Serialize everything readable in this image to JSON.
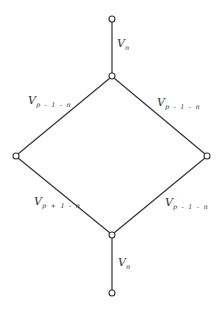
{
  "diagram": {
    "type": "lattice",
    "nodes": [
      {
        "id": "top",
        "x": 112,
        "y": 19
      },
      {
        "id": "upper",
        "x": 112,
        "y": 76
      },
      {
        "id": "left",
        "x": 16,
        "y": 156
      },
      {
        "id": "right",
        "x": 207,
        "y": 156
      },
      {
        "id": "lower",
        "x": 112,
        "y": 235
      },
      {
        "id": "bottom",
        "x": 112,
        "y": 293
      }
    ],
    "edges": [
      {
        "from": "top",
        "to": "upper",
        "label": {
          "base": "V",
          "sub": "n"
        }
      },
      {
        "from": "upper",
        "to": "left",
        "label": {
          "base": "V",
          "sub": "p-1-n"
        }
      },
      {
        "from": "upper",
        "to": "right",
        "label": {
          "base": "V",
          "sub": "p-1-n"
        }
      },
      {
        "from": "left",
        "to": "lower",
        "label": {
          "base": "V",
          "sub": "p+1-n"
        }
      },
      {
        "from": "right",
        "to": "lower",
        "label": {
          "base": "V",
          "sub": "p-1-n"
        }
      },
      {
        "from": "lower",
        "to": "bottom",
        "label": {
          "base": "V",
          "sub": "n"
        }
      }
    ]
  },
  "labels": {
    "top_edge": {
      "base": "V",
      "sub": "n"
    },
    "upper_left_edge": {
      "base": "V",
      "sub": "p - 1 - n"
    },
    "upper_right_edge": {
      "base": "V",
      "sub": "p - 1 - n"
    },
    "lower_left_edge": {
      "base": "V",
      "sub": "p + 1 - n"
    },
    "lower_right_edge": {
      "base": "V",
      "sub": "p - 1 - n"
    },
    "bottom_edge": {
      "base": "V",
      "sub": "n"
    }
  }
}
